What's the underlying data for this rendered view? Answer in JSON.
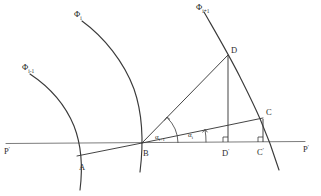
{
  "figure": {
    "type": "geometry-diagram",
    "background_color": "#ffffff",
    "line_color": "#3a3a3a",
    "axis_color": "#7d7d7d"
  },
  "axis": {
    "name": "horizontal-reference-line",
    "left_label": "P",
    "left_label_sup": "'",
    "right_label": "P",
    "right_label_sup": "'"
  },
  "curves": [
    {
      "id": "phi-i-minus-1",
      "label_base": "Φ",
      "label_sub": "i-1"
    },
    {
      "id": "phi-i",
      "label_base": "Φ",
      "label_sub": "i"
    },
    {
      "id": "phi-i-plus-1",
      "label_base": "Φ",
      "label_sub": "i+1"
    }
  ],
  "points": [
    {
      "id": "A",
      "label": "A"
    },
    {
      "id": "B",
      "label": "B"
    },
    {
      "id": "C",
      "label": "C"
    },
    {
      "id": "D",
      "label": "D"
    },
    {
      "id": "Cprime",
      "label": "C",
      "sup": "'"
    },
    {
      "id": "Dprime",
      "label": "D",
      "sup": "'"
    }
  ],
  "angles": [
    {
      "id": "alpha-i-plus-1",
      "base": "α",
      "sub": "i+1",
      "vertex": "B",
      "between": [
        "axis",
        "BD"
      ]
    },
    {
      "id": "alpha-i",
      "base": "α",
      "sub": "i",
      "vertex": "B",
      "between": [
        "axis",
        "BC"
      ]
    }
  ],
  "segments": [
    {
      "id": "AB",
      "from": "A",
      "to": "B"
    },
    {
      "id": "BC",
      "from": "B",
      "to": "C"
    },
    {
      "id": "BD",
      "from": "B",
      "to": "D"
    },
    {
      "id": "DDprime",
      "from": "D",
      "to": "Dprime"
    },
    {
      "id": "CCprime",
      "from": "C",
      "to": "Cprime"
    }
  ],
  "right_angles": [
    {
      "id": "right-angle-dprime",
      "at": "Dprime"
    },
    {
      "id": "right-angle-cprime",
      "at": "Cprime"
    }
  ]
}
